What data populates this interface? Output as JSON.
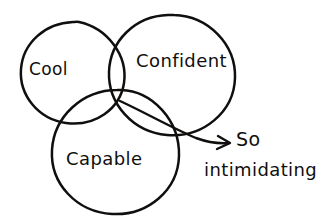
{
  "diagram": {
    "type": "venn",
    "style": "hand-drawn-sketch",
    "background_color": "#ffffff",
    "ink_color": "#100f0e",
    "circles": [
      {
        "id": "cool",
        "label": "Cool",
        "position": "left",
        "center": [
          72,
          73
        ],
        "radius": 51
      },
      {
        "id": "confident",
        "label": "Confident",
        "position": "right",
        "center": [
          170,
          75
        ],
        "radius": 61
      },
      {
        "id": "capable",
        "label": "Capable",
        "position": "bottom",
        "center": [
          116,
          152
        ],
        "radius": 62
      }
    ],
    "annotation": {
      "line_1": "So",
      "line_2": "intimidating",
      "arrow": {
        "from": "triple-intersection",
        "to": "annotation",
        "start": [
          120,
          101
        ],
        "end": [
          230,
          143
        ]
      }
    }
  }
}
